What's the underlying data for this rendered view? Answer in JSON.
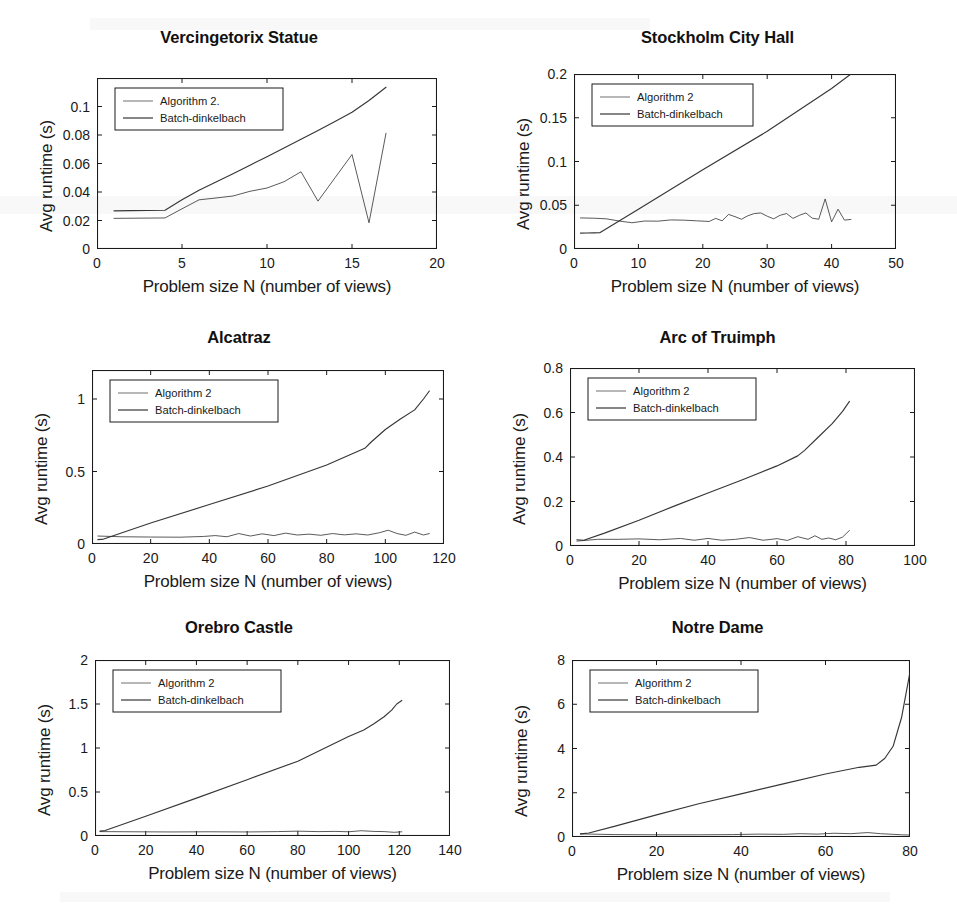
{
  "figure": {
    "background": "#ffffff",
    "line_color": "#2b2b2b",
    "axis_color": "#1a1a1a",
    "panel_count": 6,
    "layout": "3 rows x 2 columns"
  },
  "common": {
    "xlabel": "Problem size N (number of views)",
    "ylabel": "Avg runtime (s)",
    "legend_entries": [
      "Algorithm 2",
      "Batch-dinkelbach"
    ]
  },
  "chart_data": [
    {
      "type": "line",
      "title": "Vercingetorix Statue",
      "xlabel": "Problem size N (number of views)",
      "ylabel": "Avg runtime (s)",
      "xlim": [
        0,
        20
      ],
      "ylim": [
        0,
        0.12
      ],
      "xticks": [
        0,
        5,
        10,
        15,
        20
      ],
      "xtick_labels": [
        "0",
        "5",
        "10",
        "15",
        "20"
      ],
      "yticks": [
        0,
        0.02,
        0.04,
        0.06,
        0.08,
        0.1
      ],
      "ytick_labels": [
        "0",
        "0.02",
        "0.04",
        "0.06",
        "0.08",
        "0.1"
      ],
      "grid": false,
      "legend_position": "upper left",
      "series": [
        {
          "name": "Algorithm 2.",
          "x": [
            1,
            2,
            3,
            4,
            5,
            6,
            7,
            8,
            9,
            10,
            11,
            12,
            13,
            14,
            15,
            16,
            17
          ],
          "values": [
            0.0215,
            0.0216,
            0.0217,
            0.0218,
            0.0282,
            0.0345,
            0.0358,
            0.0372,
            0.0405,
            0.0428,
            0.0472,
            0.0542,
            0.0336,
            0.05,
            0.0663,
            0.0184,
            0.0812
          ]
        },
        {
          "name": "Batch-dinkelbach",
          "x": [
            1,
            2,
            3,
            4,
            5,
            6,
            7,
            8,
            9,
            10,
            11,
            12,
            13,
            14,
            15,
            16,
            17
          ],
          "values": [
            0.0268,
            0.0269,
            0.027,
            0.0272,
            0.0345,
            0.0412,
            0.047,
            0.0528,
            0.0588,
            0.0648,
            0.0708,
            0.077,
            0.0832,
            0.0895,
            0.096,
            0.1042,
            0.1135
          ]
        }
      ]
    },
    {
      "type": "line",
      "title": "Stockholm City Hall",
      "xlabel": "Problem size N (number of views)",
      "ylabel": "Avg runtime (s)",
      "xlim": [
        0,
        50
      ],
      "ylim": [
        0,
        0.2
      ],
      "xticks": [
        0,
        10,
        20,
        30,
        40,
        50
      ],
      "xtick_labels": [
        "0",
        "10",
        "20",
        "30",
        "40",
        "50"
      ],
      "yticks": [
        0,
        0.05,
        0.1,
        0.15,
        0.2
      ],
      "ytick_labels": [
        "0",
        "0.05",
        "0.1",
        "0.15",
        "0.2"
      ],
      "grid": false,
      "legend_position": "upper left",
      "series": [
        {
          "name": "Algorithm 2",
          "x": [
            1,
            3,
            5,
            7,
            9,
            11,
            13,
            15,
            17,
            19,
            21,
            22,
            23,
            24,
            25,
            26,
            27,
            28,
            29,
            30,
            31,
            32,
            33,
            34,
            35,
            36,
            37,
            38,
            39,
            40,
            41,
            42,
            43
          ],
          "values": [
            0.0355,
            0.0352,
            0.0345,
            0.032,
            0.03,
            0.032,
            0.0318,
            0.0332,
            0.033,
            0.0322,
            0.0315,
            0.035,
            0.0322,
            0.0395,
            0.037,
            0.034,
            0.038,
            0.0405,
            0.0412,
            0.0375,
            0.0345,
            0.0385,
            0.0405,
            0.035,
            0.0385,
            0.0412,
            0.0352,
            0.034,
            0.0572,
            0.031,
            0.0455,
            0.033,
            0.0338
          ]
        },
        {
          "name": "Batch-dinkelbach",
          "x": [
            1,
            2,
            3,
            4,
            10,
            20,
            30,
            40,
            43
          ],
          "values": [
            0.0182,
            0.0183,
            0.0184,
            0.0186,
            0.0455,
            0.0905,
            0.1345,
            0.1835,
            0.2
          ]
        }
      ]
    },
    {
      "type": "line",
      "title": "Alcatraz",
      "xlabel": "Problem size N (number of views)",
      "ylabel": "Avg runtime (s)",
      "xlim": [
        0,
        120
      ],
      "ylim": [
        0,
        1.2
      ],
      "xticks": [
        0,
        20,
        40,
        60,
        80,
        100,
        120
      ],
      "xtick_labels": [
        "0",
        "20",
        "40",
        "60",
        "80",
        "100",
        "120"
      ],
      "yticks": [
        0,
        0.5,
        1
      ],
      "ytick_labels": [
        "0",
        "0.5",
        "1"
      ],
      "grid": false,
      "legend_position": "upper left",
      "series": [
        {
          "name": "Algorithm 2",
          "x": [
            2,
            10,
            20,
            30,
            38,
            42,
            46,
            50,
            54,
            58,
            62,
            66,
            70,
            74,
            78,
            82,
            86,
            90,
            94,
            98,
            101,
            104,
            107,
            110,
            113,
            115
          ],
          "values": [
            0.055,
            0.05,
            0.048,
            0.047,
            0.052,
            0.058,
            0.05,
            0.072,
            0.055,
            0.07,
            0.058,
            0.075,
            0.062,
            0.068,
            0.06,
            0.072,
            0.063,
            0.07,
            0.062,
            0.078,
            0.095,
            0.072,
            0.06,
            0.082,
            0.062,
            0.072
          ]
        },
        {
          "name": "Batch-dinkelbach",
          "x": [
            2,
            4,
            20,
            40,
            60,
            80,
            93,
            95,
            100,
            105,
            110,
            113,
            115
          ],
          "values": [
            0.03,
            0.034,
            0.145,
            0.272,
            0.4,
            0.545,
            0.66,
            0.7,
            0.79,
            0.86,
            0.925,
            1.0,
            1.055
          ]
        }
      ]
    },
    {
      "type": "line",
      "title": "Arc of Truimph",
      "xlabel": "Problem size N (number of views)",
      "ylabel": "Avg runtime (s)",
      "xlim": [
        0,
        100
      ],
      "ylim": [
        0,
        0.8
      ],
      "xticks": [
        0,
        20,
        40,
        60,
        80,
        100
      ],
      "xtick_labels": [
        "0",
        "20",
        "40",
        "60",
        "80",
        "100"
      ],
      "yticks": [
        0,
        0.2,
        0.4,
        0.6,
        0.8
      ],
      "ytick_labels": [
        "0",
        "0.2",
        "0.4",
        "0.6",
        "0.8"
      ],
      "grid": false,
      "legend_position": "upper left",
      "series": [
        {
          "name": "Algorithm 2",
          "x": [
            2,
            8,
            14,
            20,
            26,
            32,
            36,
            40,
            44,
            48,
            52,
            56,
            60,
            63,
            66,
            69,
            71,
            73,
            75,
            77,
            79,
            81
          ],
          "values": [
            0.022,
            0.03,
            0.03,
            0.032,
            0.028,
            0.034,
            0.026,
            0.034,
            0.026,
            0.03,
            0.038,
            0.026,
            0.033,
            0.025,
            0.042,
            0.03,
            0.046,
            0.03,
            0.036,
            0.028,
            0.04,
            0.07
          ]
        },
        {
          "name": "Batch-dinkelbach",
          "x": [
            2,
            4,
            10,
            20,
            30,
            40,
            50,
            60,
            66,
            68,
            72,
            76,
            79,
            81
          ],
          "values": [
            0.028,
            0.026,
            0.058,
            0.116,
            0.178,
            0.238,
            0.298,
            0.36,
            0.405,
            0.43,
            0.49,
            0.55,
            0.605,
            0.65
          ]
        }
      ]
    },
    {
      "type": "line",
      "title": "Orebro Castle",
      "xlabel": "Problem size N (number of views)",
      "ylabel": "Avg runtime (s)",
      "xlim": [
        0,
        140
      ],
      "ylim": [
        0,
        2
      ],
      "xticks": [
        0,
        20,
        40,
        60,
        80,
        100,
        120,
        140
      ],
      "xtick_labels": [
        "0",
        "20",
        "40",
        "60",
        "80",
        "100",
        "120",
        "140"
      ],
      "yticks": [
        0,
        0.5,
        1,
        1.5,
        2
      ],
      "ytick_labels": [
        "0",
        "0.5",
        "1",
        "1.5",
        "2"
      ],
      "grid": false,
      "legend_position": "upper left",
      "series": [
        {
          "name": "Algorithm 2",
          "x": [
            2,
            15,
            30,
            45,
            60,
            72,
            80,
            88,
            95,
            100,
            105,
            110,
            114,
            118,
            121
          ],
          "values": [
            0.05,
            0.048,
            0.046,
            0.048,
            0.046,
            0.05,
            0.055,
            0.05,
            0.052,
            0.048,
            0.06,
            0.052,
            0.05,
            0.042,
            0.048
          ]
        },
        {
          "name": "Batch-dinkelbach",
          "x": [
            2,
            4,
            20,
            40,
            60,
            80,
            100,
            106,
            110,
            114,
            117,
            119,
            121
          ],
          "values": [
            0.055,
            0.062,
            0.225,
            0.43,
            0.64,
            0.85,
            1.13,
            1.205,
            1.275,
            1.355,
            1.43,
            1.5,
            1.54
          ]
        }
      ]
    },
    {
      "type": "line",
      "title": "Notre Dame",
      "xlabel": "Problem size N (number of views)",
      "ylabel": "Avg runtime (s)",
      "xlim": [
        0,
        80
      ],
      "ylim": [
        0,
        8
      ],
      "xticks": [
        0,
        20,
        40,
        60,
        80
      ],
      "xtick_labels": [
        "0",
        "20",
        "40",
        "60",
        "80"
      ],
      "yticks": [
        0,
        2,
        4,
        6,
        8
      ],
      "ytick_labels": [
        "0",
        "2",
        "4",
        "6",
        "8"
      ],
      "grid": false,
      "legend_position": "upper left",
      "series": [
        {
          "name": "Algorithm 2",
          "x": [
            2,
            10,
            20,
            30,
            38,
            44,
            50,
            54,
            58,
            62,
            66,
            70,
            73,
            76,
            78,
            80
          ],
          "values": [
            0.14,
            0.11,
            0.1,
            0.1,
            0.11,
            0.13,
            0.12,
            0.15,
            0.13,
            0.17,
            0.15,
            0.2,
            0.15,
            0.12,
            0.1,
            0.09
          ]
        },
        {
          "name": "Batch-dinkelbach",
          "x": [
            2,
            4,
            10,
            20,
            30,
            40,
            50,
            60,
            68,
            72,
            74,
            76,
            78,
            80
          ],
          "values": [
            0.14,
            0.18,
            0.48,
            1.0,
            1.5,
            1.95,
            2.4,
            2.85,
            3.15,
            3.25,
            3.55,
            4.1,
            5.4,
            7.45
          ]
        }
      ]
    }
  ]
}
